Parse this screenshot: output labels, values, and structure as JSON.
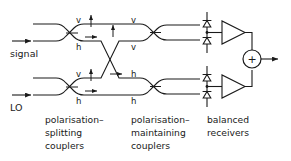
{
  "figure": {
    "background_color": "#ffffff",
    "line_color": "#1a1a1a"
  },
  "inputs": [
    {
      "name": "signal",
      "label": "signal",
      "arrow": "right-arrow-icon"
    },
    {
      "name": "lo",
      "label": "LO",
      "arrow": "right-arrow-icon"
    }
  ],
  "polarisation_labels": {
    "splitting_top_upper": "v",
    "splitting_top_lower": "h",
    "splitting_bottom_upper": "v",
    "splitting_bottom_lower": "h",
    "maintaining_top_upper": "v",
    "maintaining_top_lower": "v",
    "maintaining_bottom_upper": "h",
    "maintaining_bottom_lower": "h"
  },
  "captions": [
    {
      "name": "polarisation-splitting-couplers",
      "lines": [
        "polarisation–",
        "splitting",
        "couplers"
      ]
    },
    {
      "name": "polarisation-maintaining-couplers",
      "lines": [
        "polarisation–",
        "maintaining",
        "couplers"
      ]
    },
    {
      "name": "balanced-receivers",
      "lines": [
        "balanced",
        "receivers"
      ]
    }
  ],
  "components": {
    "photodiodes_count": 4,
    "amplifiers_count": 2,
    "summing_node_symbol": "+",
    "output_arrow": "right-arrow-icon"
  },
  "arrows": {
    "up_arrow_icon": "up-arrow-icon",
    "right_arrow_icon": "right-arrow-icon"
  }
}
